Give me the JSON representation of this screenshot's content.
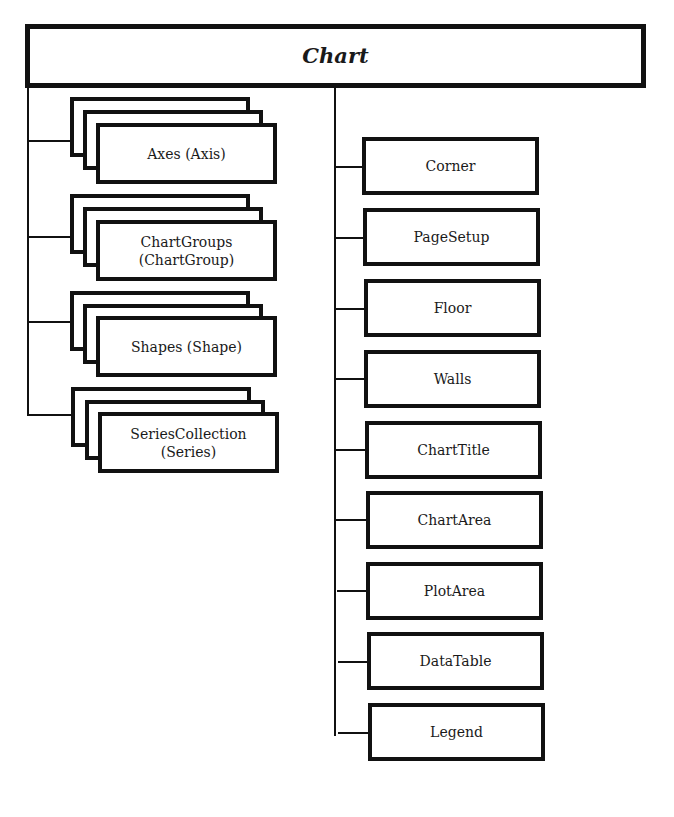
{
  "diagram": {
    "type": "object-model-hierarchy",
    "root": {
      "label": "Chart"
    },
    "collections": [
      {
        "label": "Axes (Axis)"
      },
      {
        "label": "ChartGroups\n(ChartGroup)",
        "line1": "ChartGroups",
        "line2": "(ChartGroup)"
      },
      {
        "label": "Shapes (Shape)"
      },
      {
        "label": "SeriesCollection\n(Series)",
        "line1": "SeriesCollection",
        "line2": "(Series)"
      }
    ],
    "objects": [
      {
        "label": "Corner"
      },
      {
        "label": "PageSetup"
      },
      {
        "label": "Floor"
      },
      {
        "label": "Walls"
      },
      {
        "label": "ChartTitle"
      },
      {
        "label": "ChartArea"
      },
      {
        "label": "PlotArea"
      },
      {
        "label": "DataTable"
      },
      {
        "label": "Legend"
      }
    ],
    "colors": {
      "stroke": "#111111",
      "background": "#ffffff",
      "text": "#1a1a1a"
    }
  }
}
